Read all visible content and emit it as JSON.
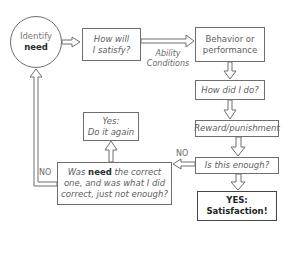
{
  "diagram": {
    "nodes": {
      "identify": {
        "line1": "Identify",
        "line2": "need"
      },
      "satisfy": {
        "line1": "How will",
        "line2": "I satisfy?"
      },
      "behavior": {
        "line1": "Behavior or",
        "line2": "performance"
      },
      "how_did": {
        "text": "How did I do?"
      },
      "reward": {
        "text": "Reward/punishment"
      },
      "enough": {
        "text": "Is this enough?"
      },
      "satisfaction": {
        "line1": "YES:",
        "line2": "Satisfaction!"
      },
      "was_need": {
        "pre": "Was ",
        "bold": "need",
        "post": " the correct",
        "line2": "one, and was what I did",
        "line3": "correct, just not enough?"
      },
      "do_again": {
        "line1": "Yes:",
        "line2": "Do it again"
      }
    },
    "edge_labels": {
      "ability": "Ability",
      "conditions": "Conditions",
      "no_left": "NO",
      "no_right": "NO"
    }
  }
}
